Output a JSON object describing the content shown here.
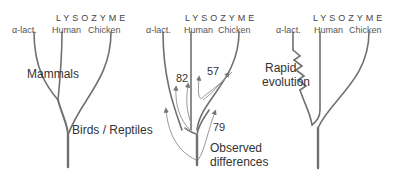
{
  "panels": [
    {
      "header": "LYSOZYME",
      "taxa": [
        "α-lact.",
        "Human",
        "Chicken"
      ],
      "annotations": {
        "mammals": "Mammals",
        "birds_reptiles": "Birds / Reptiles"
      }
    },
    {
      "header": "LYSOZYME",
      "taxa": [
        "α-lact.",
        "Human",
        "Chicken"
      ],
      "differences": [
        "82",
        "57",
        "79"
      ],
      "annotation": "Observed differences",
      "annotation_lines": [
        "Observed",
        "differences"
      ]
    },
    {
      "header": "LYSOZYME",
      "taxa": [
        "α-lact.",
        "Human",
        "Chicken"
      ],
      "annotation_lines": [
        "Rapid",
        "evolution"
      ]
    }
  ],
  "colors": {
    "branch": "#6e6e6e",
    "trunk": "#7a7a7a",
    "arrow": "#8a8a8a",
    "text": "#333333"
  }
}
